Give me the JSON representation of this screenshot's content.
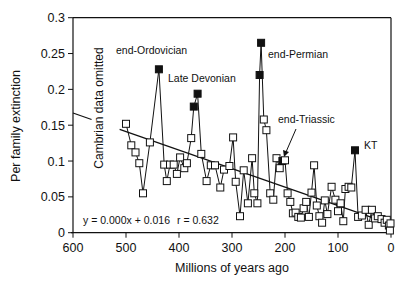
{
  "chart_data": {
    "type": "line",
    "title": "",
    "xlabel": "Millions of years ago",
    "ylabel": "Per family extinction",
    "xlim": [
      600,
      0
    ],
    "ylim": [
      0,
      0.3
    ],
    "x_ticks": [
      600,
      500,
      400,
      300,
      200,
      100,
      0
    ],
    "x_tick_labels": [
      "600",
      "500",
      "400",
      "300",
      "200",
      "100",
      "0"
    ],
    "y_ticks": [
      0,
      0.05,
      0.1,
      0.15,
      0.2,
      0.25,
      0.3
    ],
    "y_tick_labels": [
      "0",
      "0.05",
      "0.1",
      "0.15",
      "0.2",
      "0.25",
      "0.3"
    ],
    "grid": false,
    "legend": null,
    "series": [
      {
        "name": "Per family extinction",
        "marker": "open-square",
        "points": [
          [
            500,
            0.152
          ],
          [
            490,
            0.122
          ],
          [
            482,
            0.112
          ],
          [
            475,
            0.097
          ],
          [
            468,
            0.055
          ],
          [
            455,
            0.126
          ],
          [
            438,
            0.228
          ],
          [
            428,
            0.095
          ],
          [
            423,
            0.072
          ],
          [
            417,
            0.095
          ],
          [
            410,
            0.095
          ],
          [
            404,
            0.082
          ],
          [
            398,
            0.105
          ],
          [
            390,
            0.09
          ],
          [
            385,
            0.097
          ],
          [
            377,
            0.132
          ],
          [
            372,
            0.176
          ],
          [
            365,
            0.194
          ],
          [
            358,
            0.11
          ],
          [
            348,
            0.072
          ],
          [
            340,
            0.094
          ],
          [
            332,
            0.094
          ],
          [
            322,
            0.063
          ],
          [
            315,
            0.088
          ],
          [
            305,
            0.093
          ],
          [
            298,
            0.133
          ],
          [
            293,
            0.071
          ],
          [
            285,
            0.023
          ],
          [
            278,
            0.087
          ],
          [
            270,
            0.041
          ],
          [
            262,
            0.104
          ],
          [
            258,
            0.055
          ],
          [
            252,
            0.041
          ],
          [
            248,
            0.22
          ],
          [
            245,
            0.265
          ],
          [
            240,
            0.158
          ],
          [
            235,
            0.143
          ],
          [
            228,
            0.055
          ],
          [
            222,
            0.046
          ],
          [
            216,
            0.104
          ],
          [
            210,
            0.09
          ],
          [
            205,
            0.1
          ],
          [
            200,
            0.101
          ],
          [
            195,
            0.055
          ],
          [
            190,
            0.043
          ],
          [
            185,
            0.027
          ],
          [
            180,
            0.028
          ],
          [
            175,
            0.022
          ],
          [
            170,
            0.021
          ],
          [
            165,
            0.034
          ],
          [
            160,
            0.043
          ],
          [
            155,
            0.022
          ],
          [
            150,
            0.056
          ],
          [
            145,
            0.094
          ],
          [
            140,
            0.038
          ],
          [
            135,
            0.023
          ],
          [
            130,
            0.014
          ],
          [
            125,
            0.045
          ],
          [
            120,
            0.026
          ],
          [
            112,
            0.064
          ],
          [
            105,
            0.046
          ],
          [
            100,
            0.03
          ],
          [
            95,
            0.041
          ],
          [
            90,
            0.016
          ],
          [
            86,
            0.061
          ],
          [
            80,
            0.064
          ],
          [
            75,
            0.063
          ],
          [
            68,
            0.115
          ],
          [
            62,
            0.022
          ],
          [
            55,
            0.024
          ],
          [
            48,
            0.032
          ],
          [
            42,
            0.011
          ],
          [
            36,
            0.032
          ],
          [
            30,
            0.02
          ],
          [
            25,
            0.023
          ],
          [
            18,
            0.019
          ],
          [
            12,
            0.014
          ],
          [
            8,
            0.018
          ],
          [
            4,
            0.01
          ],
          [
            2,
            0.003
          ],
          [
            1,
            0.013
          ]
        ],
        "highlighted_events": [
          {
            "label": "end-Ordovician",
            "x": 438,
            "y": 0.228
          },
          {
            "label": "Late Devonian",
            "x": 372,
            "y": 0.176
          },
          {
            "label": "Late Devonian",
            "x": 365,
            "y": 0.194
          },
          {
            "label": "end-Permian",
            "x": 248,
            "y": 0.22
          },
          {
            "label": "end-Permian",
            "x": 245,
            "y": 0.265
          },
          {
            "label": "end-Triassic",
            "x": 205,
            "y": 0.1
          },
          {
            "label": "KT",
            "x": 68,
            "y": 0.115
          }
        ]
      },
      {
        "name": "Linear regression",
        "marker": "none",
        "equation": "y = 0.000x + 0.016",
        "r": 0.632,
        "points": [
          [
            600,
            0.167
          ],
          [
            0,
            0.012
          ]
        ]
      }
    ],
    "annotations": [
      {
        "text": "end-Ordovician",
        "x": 438,
        "y": 0.228
      },
      {
        "text": "Late Devonian",
        "x": 367,
        "y": 0.19
      },
      {
        "text": "end-Permian",
        "x": 245,
        "y": 0.265
      },
      {
        "text": "end-Triassic",
        "x": 205,
        "y": 0.1,
        "arrow": true
      },
      {
        "text": "KT",
        "x": 68,
        "y": 0.115
      },
      {
        "text": "Cambrian data omitted",
        "orientation": "vertical",
        "x": 545
      }
    ]
  },
  "labels": {
    "ylabel": "Per family extinction",
    "xlabel": "Millions of years ago",
    "cambrian_note": "Cambrian data omitted",
    "equation": "y = 0.000x + 0.016",
    "r_value": "r = 0.632",
    "events": {
      "ordovician": "end-Ordovician",
      "devonian": "Late Devonian",
      "permian": "end-Permian",
      "triassic": "end-Triassic",
      "kt": "KT"
    }
  }
}
